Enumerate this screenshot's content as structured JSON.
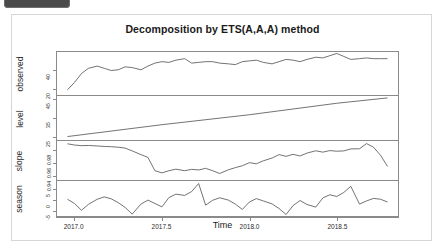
{
  "window": {
    "tab_label": ""
  },
  "chart_data": {
    "type": "line",
    "title": "Decomposition by ETS(A,A,A) method",
    "xlabel": "Time",
    "ylabel": "",
    "grid": false,
    "legend_position": "none",
    "xlim": [
      2016.9,
      2018.85
    ],
    "xticks": [
      "2017.0",
      "2017.5",
      "2018.0",
      "2018.5"
    ],
    "xtick_values": [
      2017.0,
      2017.5,
      2018.0,
      2018.5
    ],
    "panels": [
      {
        "name": "observed",
        "label": "observed",
        "yticks": [
          "20",
          "40"
        ],
        "ytick_values": [
          20,
          40
        ],
        "ylim": [
          17,
          46
        ],
        "x": [
          2016.96,
          2017.0,
          2017.04,
          2017.08,
          2017.13,
          2017.17,
          2017.21,
          2017.25,
          2017.29,
          2017.33,
          2017.38,
          2017.42,
          2017.46,
          2017.5,
          2017.54,
          2017.58,
          2017.63,
          2017.67,
          2017.71,
          2017.75,
          2017.79,
          2017.83,
          2017.88,
          2017.92,
          2017.96,
          2018.0,
          2018.04,
          2018.08,
          2018.13,
          2018.17,
          2018.21,
          2018.25,
          2018.29,
          2018.33,
          2018.38,
          2018.42,
          2018.46,
          2018.5,
          2018.54,
          2018.58,
          2018.63,
          2018.67,
          2018.71,
          2018.75,
          2018.79
        ],
        "values": [
          20.5,
          25.5,
          31.5,
          35.0,
          36.5,
          35.0,
          33.5,
          34.0,
          36.0,
          35.5,
          34.0,
          36.5,
          38.5,
          39.5,
          39.0,
          40.5,
          41.5,
          38.5,
          39.0,
          39.5,
          39.5,
          38.5,
          38.0,
          37.5,
          39.5,
          40.0,
          40.5,
          39.0,
          38.0,
          39.5,
          41.0,
          40.5,
          39.5,
          41.0,
          42.5,
          42.0,
          43.5,
          45.0,
          43.0,
          41.0,
          41.5,
          42.0,
          41.5,
          41.5,
          41.5
        ]
      },
      {
        "name": "level",
        "label": "level",
        "yticks": [
          "25",
          "35",
          "45"
        ],
        "ytick_values": [
          25,
          35,
          45
        ],
        "ylim": [
          23,
          46
        ],
        "x": [
          2016.96,
          2017.5,
          2018.0,
          2018.5,
          2018.79
        ],
        "values": [
          24.8,
          31.0,
          36.2,
          42.2,
          45.0
        ]
      },
      {
        "name": "slope",
        "label": "slope",
        "yticks": [
          "0.94",
          "0.96",
          "0.98"
        ],
        "ytick_values": [
          0.94,
          0.96,
          0.98
        ],
        "ylim": [
          0.929,
          0.992
        ],
        "x": [
          2016.96,
          2017.0,
          2017.04,
          2017.08,
          2017.13,
          2017.17,
          2017.21,
          2017.25,
          2017.29,
          2017.33,
          2017.38,
          2017.42,
          2017.46,
          2017.5,
          2017.54,
          2017.58,
          2017.63,
          2017.67,
          2017.71,
          2017.75,
          2017.79,
          2017.83,
          2017.88,
          2017.92,
          2017.96,
          2018.0,
          2018.04,
          2018.08,
          2018.13,
          2018.17,
          2018.21,
          2018.25,
          2018.29,
          2018.33,
          2018.38,
          2018.42,
          2018.46,
          2018.5,
          2018.54,
          2018.58,
          2018.63,
          2018.67,
          2018.71,
          2018.75,
          2018.79
        ],
        "values": [
          0.9875,
          0.9855,
          0.9845,
          0.9848,
          0.984,
          0.9832,
          0.9828,
          0.982,
          0.9805,
          0.976,
          0.97,
          0.9655,
          0.944,
          0.9405,
          0.944,
          0.9465,
          0.944,
          0.9462,
          0.9452,
          0.9478,
          0.944,
          0.9395,
          0.9455,
          0.949,
          0.952,
          0.957,
          0.9552,
          0.96,
          0.9645,
          0.97,
          0.9672,
          0.9705,
          0.9678,
          0.9725,
          0.9762,
          0.974,
          0.9765,
          0.9755,
          0.976,
          0.9792,
          0.9795,
          0.9878,
          0.982,
          0.969,
          0.951
        ]
      },
      {
        "name": "season",
        "label": "season",
        "yticks": [
          "-5",
          "0",
          "5"
        ],
        "ytick_values": [
          -5,
          0,
          5
        ],
        "ylim": [
          -8.5,
          8.0
        ],
        "x": [
          2016.96,
          2017.0,
          2017.04,
          2017.08,
          2017.13,
          2017.17,
          2017.21,
          2017.25,
          2017.29,
          2017.33,
          2017.38,
          2017.42,
          2017.46,
          2017.5,
          2017.54,
          2017.58,
          2017.63,
          2017.67,
          2017.71,
          2017.75,
          2017.79,
          2017.83,
          2017.88,
          2017.92,
          2017.96,
          2018.0,
          2018.04,
          2018.08,
          2018.13,
          2018.17,
          2018.21,
          2018.25,
          2018.29,
          2018.33,
          2018.38,
          2018.42,
          2018.46,
          2018.5,
          2018.54,
          2018.58,
          2018.63,
          2018.67,
          2018.71,
          2018.75,
          2018.79
        ],
        "values": [
          -0.6,
          -2.6,
          -5.8,
          -3.0,
          -0.6,
          0.5,
          -0.4,
          -2.2,
          -4.5,
          -7.6,
          -2.9,
          -1.0,
          -2.6,
          -4.2,
          0.2,
          1.8,
          1.2,
          3.0,
          6.8,
          -3.4,
          -1.1,
          0.1,
          -1.0,
          -2.9,
          -5.4,
          -1.9,
          -0.3,
          -1.4,
          -2.8,
          -5.0,
          -7.8,
          -3.6,
          -1.2,
          -3.1,
          -4.3,
          0.0,
          1.5,
          0.7,
          2.6,
          5.5,
          -2.9,
          -1.4,
          -0.2,
          -0.6,
          -1.9
        ]
      }
    ]
  }
}
